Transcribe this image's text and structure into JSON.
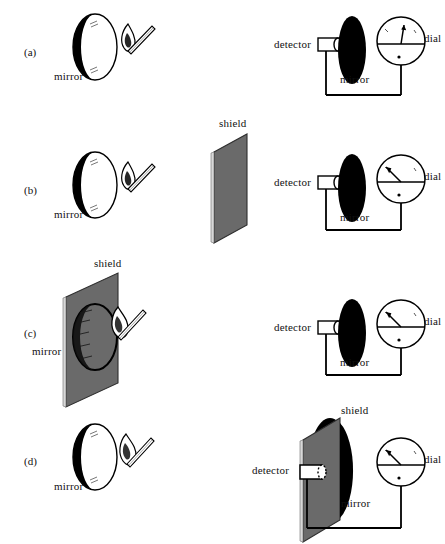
{
  "figure": {
    "type": "physics-diagram",
    "colors": {
      "ink": "#000000",
      "shield_gray": "#6a6a6a",
      "shield_edge": "#3a3a3a",
      "mirror_black": "#000000",
      "paper": "#ffffff"
    }
  },
  "labels": {
    "mirror": "mirror",
    "shield": "shield",
    "detector": "detector",
    "dial": "dial"
  },
  "panels": [
    {
      "id": "a",
      "label": "(a)",
      "left": {
        "mirror_label": "mirror",
        "has_flame": true,
        "has_shield": false,
        "mirror_face": "reflective"
      },
      "right": {
        "detector_label": "detector",
        "mirror_label": "mirror",
        "dial_label": "dial",
        "has_shield": false,
        "needle_direction": "up",
        "needle_angle_deg": -80,
        "detector_style": "filled-outline"
      }
    },
    {
      "id": "b",
      "label": "(b)",
      "left": {
        "mirror_label": "mirror",
        "has_flame": true,
        "has_shield": false,
        "mirror_face": "reflective"
      },
      "middle": {
        "shield_label": "shield",
        "has_shield": true
      },
      "right": {
        "detector_label": "detector",
        "mirror_label": "mirror",
        "dial_label": "dial",
        "has_shield": false,
        "needle_direction": "up-left",
        "needle_angle_deg": -140,
        "detector_style": "filled-outline"
      }
    },
    {
      "id": "c",
      "label": "(c)",
      "left": {
        "mirror_label": "mirror",
        "shield_label": "shield",
        "has_flame": true,
        "has_shield": true,
        "shield_position": "in-front-of-mirror",
        "mirror_face": "behind-shield"
      },
      "right": {
        "detector_label": "detector",
        "mirror_label": "mirror",
        "dial_label": "dial",
        "has_shield": false,
        "needle_direction": "up-left",
        "needle_angle_deg": -140,
        "detector_style": "filled-outline"
      }
    },
    {
      "id": "d",
      "label": "(d)",
      "left": {
        "mirror_label": "mirror",
        "has_flame": true,
        "has_shield": false,
        "mirror_face": "reflective"
      },
      "right": {
        "detector_label": "detector",
        "mirror_label": "mirror",
        "shield_label": "shield",
        "dial_label": "dial",
        "has_shield": true,
        "shield_position": "in-front-of-detector-and-mirror",
        "needle_direction": "up-left",
        "needle_angle_deg": -140,
        "detector_style": "hollow"
      }
    }
  ]
}
